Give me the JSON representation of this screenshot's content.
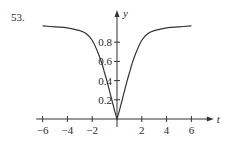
{
  "problem_number": "53.",
  "chart_data": {
    "type": "line",
    "title": "",
    "xlabel": "t",
    "ylabel": "y",
    "xlim": [
      -7,
      7
    ],
    "ylim": [
      0,
      1.05
    ],
    "grid": false,
    "x_ticks": [
      -6,
      -4,
      -2,
      2,
      4,
      6
    ],
    "x_tick_labels": [
      "−6",
      "−4",
      "−2",
      "2",
      "4",
      "6"
    ],
    "y_ticks": [
      0.2,
      0.4,
      0.6,
      0.8
    ],
    "y_tick_labels": [
      "0.2",
      "0.4",
      "0.6",
      "0.8"
    ],
    "series": [
      {
        "name": "y(t)",
        "x": [
          -6,
          -5,
          -4,
          -3,
          -2.5,
          -2,
          -1.5,
          -1.2,
          -1,
          -0.8,
          -0.6,
          -0.4,
          -0.2,
          0,
          0.2,
          0.4,
          0.6,
          0.8,
          1,
          1.2,
          1.5,
          2,
          2.5,
          3,
          4,
          5,
          6
        ],
        "y": [
          0.97,
          0.96,
          0.95,
          0.92,
          0.89,
          0.82,
          0.68,
          0.57,
          0.48,
          0.39,
          0.29,
          0.19,
          0.09,
          0,
          0.09,
          0.19,
          0.29,
          0.39,
          0.48,
          0.57,
          0.68,
          0.82,
          0.89,
          0.92,
          0.95,
          0.96,
          0.97
        ]
      }
    ]
  }
}
